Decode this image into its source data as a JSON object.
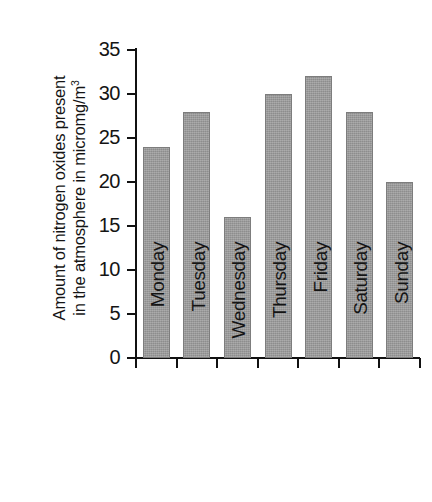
{
  "chart_data": {
    "type": "bar",
    "title": "",
    "subtitle": "",
    "xlabel": "",
    "ylabel": "Amount of nitrogen oxides present in the atmosphere in micromg/m3",
    "ylabel_line1": "Amount of nitrogen oxides present",
    "ylabel_line2_pre": "in the atmosphere in micromg/m",
    "ylabel_line2_sup": "3",
    "categories": [
      "Monday",
      "Tuesday",
      "Wednesday",
      "Thursday",
      "Friday",
      "Saturday",
      "Sunday"
    ],
    "values": [
      24,
      28,
      16,
      30,
      32,
      28,
      20
    ],
    "ylim": [
      0,
      35
    ],
    "yticks": [
      0,
      5,
      10,
      15,
      20,
      25,
      30,
      35
    ],
    "ytick_labels": [
      "0",
      "5",
      "10",
      "15",
      "20",
      "25",
      "30",
      "35"
    ],
    "grid": false,
    "legend": false,
    "legend_position": "none",
    "bar_color": "#9b9b9b",
    "bar_edge_color": "#7d7d7d",
    "axis_color": "#111111",
    "background_color": "#ffffff"
  }
}
